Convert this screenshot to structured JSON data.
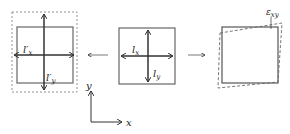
{
  "diagram": {
    "left_panel": {
      "label_x": "l′x",
      "label_x_main": "l′",
      "label_x_sub": "x",
      "label_y_main": "l′",
      "label_y_sub": "y"
    },
    "center_panel": {
      "label_x_main": "l",
      "label_x_sub": "x",
      "label_y_main": "l",
      "label_y_sub": "y"
    },
    "right_panel": {
      "label_main": "ε",
      "label_sub": "xy"
    },
    "axes": {
      "x_label": "x",
      "y_label": "y"
    },
    "colors": {
      "stroke": "#555555",
      "dashed": "#666666"
    }
  }
}
